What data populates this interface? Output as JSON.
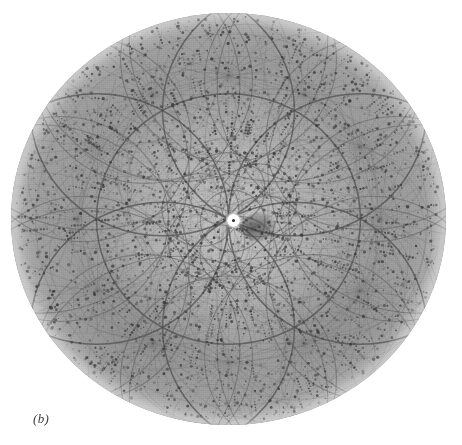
{
  "figure": {
    "caption": "(b)",
    "kind": "kossel-diffraction-photograph",
    "background_color": "#ffffff",
    "plate": {
      "shape": "circle",
      "center_x": 228,
      "center_y": 219,
      "radius_x": 217,
      "radius_y": 206,
      "base_color": "#a7a7a7",
      "highlight_color": "#b8b8b8",
      "line_color": "#4d4d4d",
      "spot_color": "#3a3a3a"
    },
    "beam_stop": {
      "label": "beam-stop",
      "center_x": 233,
      "center_y": 221,
      "disc_color": "#ffffff",
      "dot_color": "#2e2e2e",
      "shadow_color": "#3c3c3c"
    }
  },
  "chart_data": {
    "type": "scatter",
    "title": "",
    "subtitle": "",
    "xlabel": "",
    "ylabel": "",
    "annotations": [
      "(b)"
    ],
    "legend": [],
    "grid": false,
    "geometry": {
      "plate_center": [
        228,
        219
      ],
      "plate_radius": [
        217,
        206
      ],
      "beam_stop_center": [
        233,
        221
      ],
      "beam_stop_radius": 6
    },
    "kossel_rosette": {
      "ring_count": 6,
      "ring_radius": 132,
      "ring_centers_radius": 132,
      "ring_center_angles_deg": [
        0,
        60,
        120,
        180,
        240,
        300
      ],
      "inner_ring_count": 6,
      "inner_ring_radius": 62,
      "inner_centers_radius": 62,
      "outer_ring_count": 12,
      "outer_ring_radius": 150,
      "outer_centers_radius": 196
    },
    "radial_star_nodes_deg": [
      0,
      30,
      60,
      90,
      120,
      150,
      180,
      210,
      240,
      270,
      300,
      330
    ],
    "spot_count_estimate": 2600
  }
}
